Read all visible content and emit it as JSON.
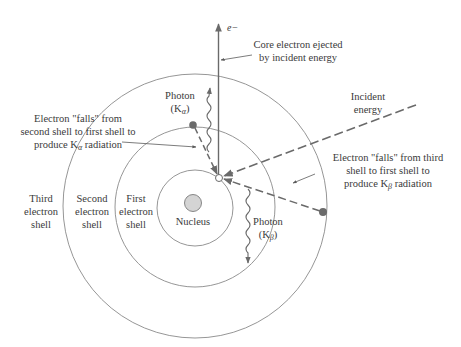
{
  "diagram": {
    "colors": {
      "line": "#7a7a7a",
      "text": "#3a3a3a",
      "electron": "#6b6b6b",
      "nucleus_fill": "#d4d4d4",
      "arrow": "#6a6a6a"
    },
    "labels": {
      "ejected_particle": "e−",
      "core_ejected_line1": "Core electron ejected",
      "core_ejected_line2": "by incident energy",
      "incident_line1": "Incident",
      "incident_line2": "energy",
      "photon_alpha_line1": "Photon",
      "photon_alpha_line2_pre": "(K",
      "photon_alpha_sub": "α",
      "photon_alpha_line2_post": ")",
      "photon_beta_line1": "Photon",
      "photon_beta_line2_pre": "(K",
      "photon_beta_sub": "β",
      "photon_beta_line2_post": ")",
      "falls_second_line1": "Electron \"falls\" from",
      "falls_second_line2": "second shell to first shell to",
      "falls_second_line3_pre": "produce K",
      "falls_second_sub": "α",
      "falls_second_line3_post": " radiation",
      "falls_third_line1": "Electron \"falls\" from third",
      "falls_third_line2": "shell to first shell to",
      "falls_third_line3_pre": "produce K",
      "falls_third_sub": "β",
      "falls_third_line3_post": " radiation",
      "third_shell_line1": "Third",
      "third_shell_line2": "electron",
      "third_shell_line3": "shell",
      "second_shell_line1": "Second",
      "second_shell_line2": "electron",
      "second_shell_line3": "shell",
      "first_shell_line1": "First",
      "first_shell_line2": "electron",
      "first_shell_line3": "shell",
      "nucleus": "Nucleus"
    },
    "shells": [
      {
        "name": "first",
        "radius": 38
      },
      {
        "name": "second",
        "radius": 80
      },
      {
        "name": "third",
        "radius": 132
      }
    ]
  }
}
